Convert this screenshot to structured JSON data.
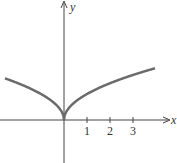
{
  "chart_data": {
    "type": "line",
    "title": "",
    "xlabel": "x",
    "ylabel": "y",
    "x_ticks": [
      "1",
      "2",
      "3"
    ],
    "xlim": [
      -2.6,
      4.6
    ],
    "function": "y = sqrt(|x|)",
    "series": [
      {
        "name": "curve",
        "x": [
          -2.5,
          -2,
          -1.5,
          -1,
          -0.5,
          -0.1,
          0,
          0.1,
          0.5,
          1,
          1.5,
          2,
          2.5,
          3,
          3.5,
          4
        ],
        "values": [
          1.58,
          1.41,
          1.22,
          1.0,
          0.71,
          0.32,
          0,
          0.32,
          0.71,
          1.0,
          1.22,
          1.41,
          1.58,
          1.73,
          1.87,
          2.0
        ]
      }
    ],
    "grid": false,
    "colors": {
      "curve": "#6b6b6b",
      "axis": "#444444"
    }
  }
}
